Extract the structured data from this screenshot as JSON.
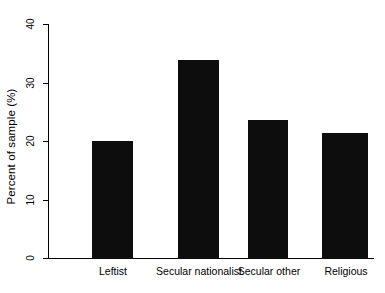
{
  "chart_data": {
    "type": "bar",
    "title": "",
    "xlabel": "",
    "ylabel": "Percent of sample (%)",
    "categories": [
      "Leftist",
      "Secular nationalist",
      "Secular other",
      "Religious"
    ],
    "values": [
      20.2,
      34.0,
      23.7,
      21.6
    ],
    "ylim": [
      0,
      40
    ],
    "yticks": [
      0,
      10,
      20,
      30,
      40
    ],
    "ytick_labels": [
      "0",
      "10",
      "20",
      "30",
      "40"
    ],
    "grid": false,
    "legend": null,
    "bar_color": "#0d0d0d",
    "axis_color": "#000000",
    "background_color": "#ffffff"
  }
}
